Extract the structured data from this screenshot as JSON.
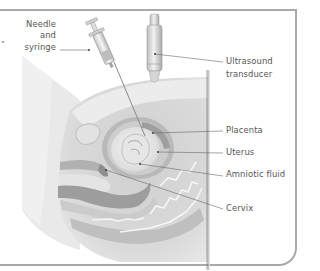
{
  "figure": {
    "labels": {
      "needle_line1": "Needle",
      "needle_line2": "and",
      "needle_line3": "syringe",
      "transducer_line1": "Ultrasound",
      "transducer_line2": "transducer",
      "placenta": "Placenta",
      "uterus": "Uterus",
      "amniotic_fluid": "Amniotic fluid",
      "cervix": "Cervix"
    },
    "colors": {
      "frame": "#a9a9a9",
      "label_text": "#555555",
      "leader_line": "#666666",
      "tissue_light": "#e6e6e6",
      "tissue_mid": "#c8c8c8",
      "tissue_dark": "#a8a8a8"
    }
  }
}
